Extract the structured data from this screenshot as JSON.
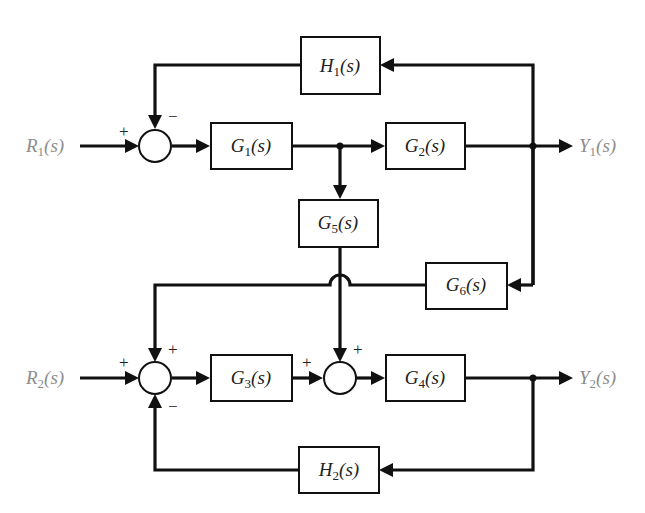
{
  "diagram": {
    "type": "block_diagram",
    "colors": {
      "line": "#111111",
      "signal_text": "#8c8c8c",
      "block_text": "#222222",
      "background": "#ffffff"
    },
    "inputs": [
      {
        "id": "R1",
        "main": "R",
        "sub": "1",
        "tail": "(s)"
      },
      {
        "id": "R2",
        "main": "R",
        "sub": "2",
        "tail": "(s)"
      }
    ],
    "outputs": [
      {
        "id": "Y1",
        "main": "Y",
        "sub": "1",
        "tail": "(s)"
      },
      {
        "id": "Y2",
        "main": "Y",
        "sub": "2",
        "tail": "(s)"
      }
    ],
    "blocks": [
      {
        "id": "H1",
        "main": "H",
        "sub": "1",
        "tail": "(s)"
      },
      {
        "id": "G1",
        "main": "G",
        "sub": "1",
        "tail": "(s)"
      },
      {
        "id": "G2",
        "main": "G",
        "sub": "2",
        "tail": "(s)"
      },
      {
        "id": "G5",
        "main": "G",
        "sub": "5",
        "tail": "(s)"
      },
      {
        "id": "G6",
        "main": "G",
        "sub": "6",
        "tail": "(s)"
      },
      {
        "id": "G3",
        "main": "G",
        "sub": "3",
        "tail": "(s)"
      },
      {
        "id": "G4",
        "main": "G",
        "sub": "4",
        "tail": "(s)"
      },
      {
        "id": "H2",
        "main": "H",
        "sub": "2",
        "tail": "(s)"
      }
    ],
    "summing_junctions": [
      {
        "id": "S1",
        "signs": {
          "left": "+",
          "top": "−"
        }
      },
      {
        "id": "S2",
        "signs": {
          "left": "+",
          "top": "+",
          "bottom": "−"
        }
      },
      {
        "id": "S3",
        "signs": {
          "left": "+",
          "top": "+"
        }
      }
    ],
    "connections": [
      "R1 → S1(+)",
      "S1 → G1",
      "G1 → G2",
      "G1 → G5",
      "G2 → Y1",
      "Y1 → H1",
      "H1 → S1(−)",
      "Y1 → G6",
      "G6 → S2(+)",
      "R2 → S2(+)",
      "S2 → G3",
      "G3 → S3(+)",
      "G5 → S3(+)",
      "S3 → G4",
      "G4 → Y2",
      "Y2 → H2",
      "H2 → S2(−)"
    ]
  }
}
